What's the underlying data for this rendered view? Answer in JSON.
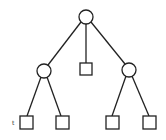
{
  "diagram": {
    "type": "tree",
    "colors": {
      "stroke": "#222222",
      "background": "#ffffff"
    },
    "nodes": [
      {
        "id": "root",
        "shape": "circle",
        "cx": 86,
        "cy": 17,
        "r": 7
      },
      {
        "id": "left",
        "shape": "circle",
        "cx": 44,
        "cy": 71,
        "r": 7
      },
      {
        "id": "middle-leaf",
        "shape": "square",
        "x": 80,
        "y": 63,
        "size": 12
      },
      {
        "id": "right",
        "shape": "circle",
        "cx": 129,
        "cy": 70,
        "r": 7
      },
      {
        "id": "leaf-1",
        "shape": "square",
        "x": 20,
        "y": 116,
        "size": 13,
        "label": "t"
      },
      {
        "id": "leaf-2",
        "shape": "square",
        "x": 56,
        "y": 116,
        "size": 13
      },
      {
        "id": "leaf-3",
        "shape": "square",
        "x": 106,
        "y": 116,
        "size": 13
      },
      {
        "id": "leaf-4",
        "shape": "square",
        "x": 143,
        "y": 116,
        "size": 13
      }
    ],
    "edges": [
      {
        "from": "root",
        "to": "left"
      },
      {
        "from": "root",
        "to": "middle-leaf"
      },
      {
        "from": "root",
        "to": "right"
      },
      {
        "from": "left",
        "to": "leaf-1"
      },
      {
        "from": "left",
        "to": "leaf-2"
      },
      {
        "from": "right",
        "to": "leaf-3"
      },
      {
        "from": "right",
        "to": "leaf-4"
      }
    ],
    "labels": {
      "leaf_1": "t"
    }
  }
}
